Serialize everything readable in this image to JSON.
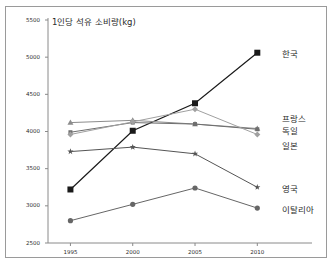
{
  "chart_data": {
    "type": "line",
    "title": "1인당 석유 소비량(kg)",
    "xlabel": "",
    "ylabel": "",
    "x": [
      1995,
      2000,
      2005,
      2010
    ],
    "categories": [
      "1995",
      "2000",
      "2005",
      "2010"
    ],
    "xticklabels": [
      "1995",
      "2000",
      "2005",
      "2010"
    ],
    "yticklabels": [
      "2500",
      "3000",
      "3500",
      "4000",
      "4500",
      "5000",
      "5500"
    ],
    "yticks": [
      2500,
      3000,
      3500,
      4000,
      4500,
      5000,
      5500
    ],
    "ylim": [
      2500,
      5500
    ],
    "xlim": [
      1993.2,
      2011.5
    ],
    "grid": false,
    "legend_position": "right-inline",
    "series": [
      {
        "name": "한국",
        "label": "한국",
        "marker": "square",
        "color": "#1a1a1a",
        "values": [
          3220,
          4010,
          4380,
          5060
        ]
      },
      {
        "name": "프랑스",
        "label": "프랑스",
        "marker": "triangle",
        "color": "#8c8c8c",
        "values": [
          4120,
          4150,
          4100,
          4040
        ]
      },
      {
        "name": "독일",
        "label": "독일",
        "marker": "square-small",
        "color": "#6e6e6e",
        "values": [
          3990,
          4120,
          4100,
          4030
        ]
      },
      {
        "name": "일본",
        "label": "일본",
        "marker": "diamond",
        "color": "#a0a0a0",
        "values": [
          3960,
          4130,
          4300,
          3960
        ]
      },
      {
        "name": "영국",
        "label": "영국",
        "marker": "star",
        "color": "#555555",
        "values": [
          3730,
          3790,
          3700,
          3250
        ]
      },
      {
        "name": "이탈리아",
        "label": "이탈리아",
        "marker": "circle",
        "color": "#666666",
        "values": [
          2800,
          3020,
          3240,
          2970
        ]
      }
    ]
  },
  "colors": {
    "frame": "#9a9a9a",
    "axis": "#8a8a8a",
    "text": "#2b2b2b",
    "background": "#ffffff"
  }
}
